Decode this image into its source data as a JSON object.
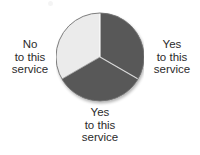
{
  "figure": {
    "background_color": "#ffffff",
    "width": 200,
    "height": 155
  },
  "chart_data": {
    "type": "pie",
    "title": "",
    "subtitle": "",
    "xlabel": "",
    "ylabel": "",
    "grid": false,
    "legend_position": "none",
    "center_x": 100,
    "center_y": 57,
    "radius": 44,
    "start_angle_deg": 0,
    "direction": "clockwise",
    "labels": [
      "Yes to this service",
      "Yes to this service",
      "No to this service"
    ],
    "values": [
      33.3,
      33.3,
      33.3
    ],
    "percentages": [
      "33.3%",
      "33.3%",
      "33.3%"
    ],
    "colors": [
      "#585858",
      "#585858",
      "#ebebeb"
    ],
    "slices": [
      {
        "name": "slice-right",
        "label": "Yes to this service",
        "value": 33.3,
        "color": "#585858",
        "start_angle_deg": 0,
        "end_angle_deg": 120,
        "label_position": "right"
      },
      {
        "name": "slice-bottom",
        "label": "Yes to this service",
        "value": 33.3,
        "color": "#585858",
        "start_angle_deg": 120,
        "end_angle_deg": 240,
        "label_position": "bottom"
      },
      {
        "name": "slice-left",
        "label": "No to this service",
        "value": 33.3,
        "color": "#ebebeb",
        "start_angle_deg": 240,
        "end_angle_deg": 360,
        "label_position": "left"
      }
    ],
    "outline_color": "#707070",
    "separator_color": "#d8d8d8"
  },
  "labels": {
    "left": {
      "line1": "No",
      "line2": "to this",
      "line3": "service"
    },
    "right": {
      "line1": "Yes",
      "line2": "to this",
      "line3": "service"
    },
    "bottom": {
      "line1": "Yes",
      "line2": "to this",
      "line3": "service"
    }
  },
  "colors": {
    "slice_dark": "#585858",
    "slice_light": "#ebebeb",
    "text": "#2b2b2b",
    "outline": "#707070",
    "separator": "#d8d8d8",
    "background": "#ffffff"
  }
}
